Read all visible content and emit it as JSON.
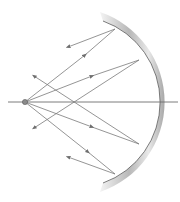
{
  "diagram": {
    "type": "concave-mirror-ray-diagram",
    "colors": {
      "background": "#ffffff",
      "ray": "#7a7a7a",
      "axis": "#6e6e6e",
      "mirror_dark": "#9a9a9a",
      "mirror_light": "#f2f2f2",
      "mirror_edge": "#5a5a5a",
      "source": "#8a8a8a"
    },
    "source": {
      "x": 25,
      "y": 102
    },
    "axis": {
      "x1": 8,
      "y1": 102,
      "x2": 178,
      "y2": 102
    },
    "mirror_points": [
      {
        "name": "top",
        "x": 115,
        "y": 29
      },
      {
        "name": "upper",
        "x": 139,
        "y": 60
      },
      {
        "name": "lower",
        "x": 139,
        "y": 144
      },
      {
        "name": "bottom",
        "x": 115,
        "y": 174
      }
    ],
    "reflected_ends": [
      {
        "name": "top",
        "x": 68,
        "y": 45
      },
      {
        "name": "upper",
        "x": 32,
        "y": 129
      },
      {
        "name": "lower",
        "x": 32,
        "y": 75
      },
      {
        "name": "bottom",
        "x": 68,
        "y": 158
      }
    ]
  }
}
